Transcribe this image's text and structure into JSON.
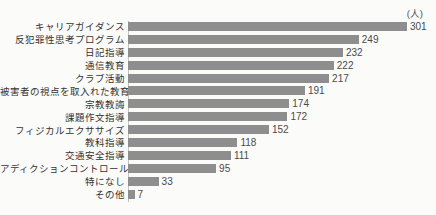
{
  "chart_data": {
    "type": "bar",
    "orientation": "horizontal",
    "title": "",
    "unit_label": "(人)",
    "categories": [
      "キャリアガイダンス",
      "反犯罪性思考プログラム",
      "日記指導",
      "通信教育",
      "クラブ活動",
      "被害者の視点を取入れた教育",
      "宗教教誨",
      "課題作文指導",
      "フィジカルエクササイズ",
      "教科指導",
      "交通安全指導",
      "アディクションコントロール",
      "特になし",
      "その他"
    ],
    "values": [
      301,
      249,
      232,
      222,
      217,
      191,
      174,
      172,
      152,
      118,
      111,
      95,
      33,
      7
    ],
    "xlim": [
      0,
      310
    ],
    "bar_color": "#8e8e8e",
    "label_color": "#333333",
    "value_color": "#4a4a4a",
    "grid": false,
    "legend": "none"
  }
}
